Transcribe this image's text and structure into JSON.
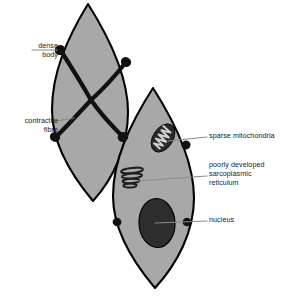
{
  "figure": {
    "colors": {
      "cell_fill": "#a8a8a8",
      "outline": "#000000",
      "dense_body": "#111111",
      "fibre": "#111111",
      "nucleus": "#2e2e2e",
      "mitochondrion": "#2b2b2b",
      "cristae": "#c9c9c9",
      "reticulum": "#232323",
      "leader_line": "#8a8a8a",
      "background": "#ffffff",
      "label_text": "#1a1a1a"
    },
    "cells": [
      {
        "name": "left-smooth-muscle-cell",
        "apex_top": [
          88,
          4
        ],
        "apex_bottom": [
          93,
          201
        ],
        "widest": 76
      },
      {
        "name": "right-smooth-muscle-cell",
        "apex_top": [
          153,
          88
        ],
        "apex_bottom": [
          155,
          288
        ],
        "widest": 80
      }
    ],
    "dense_bodies": [
      {
        "name": "dense-body-upper-left",
        "x": 60,
        "y": 50
      },
      {
        "name": "dense-body-upper-right",
        "x": 126,
        "y": 62
      },
      {
        "name": "dense-body-lower-left",
        "x": 55,
        "y": 137
      },
      {
        "name": "dense-body-lower-right",
        "x": 123,
        "y": 137
      },
      {
        "name": "dense-body-right-cell-upper",
        "x": 186,
        "y": 145
      },
      {
        "name": "dense-body-right-cell-left",
        "x": 117,
        "y": 222
      },
      {
        "name": "dense-body-right-cell-right",
        "x": 187,
        "y": 222
      }
    ],
    "fibre_crossing": [
      91,
      100
    ],
    "organelles": {
      "mitochondrion": {
        "cx": 163,
        "cy": 138,
        "rx": 10,
        "ry": 15,
        "rotation": 35
      },
      "sarcoplasmic_reticulum": {
        "cx": 132,
        "cy": 178,
        "cisternae": 4
      },
      "nucleus": {
        "cx": 157,
        "cy": 223,
        "rx": 18,
        "ry": 24
      }
    }
  },
  "labels": {
    "dense_body": "dense\nbody",
    "contractile_fibre": "contractile\nfibre",
    "sparse_mitochondria": "sparse mitochondria",
    "sarcoplasmic_reticulum": "poorly developed\nsarcoplasmic\nreticulum",
    "nucleus": "nucleus"
  }
}
